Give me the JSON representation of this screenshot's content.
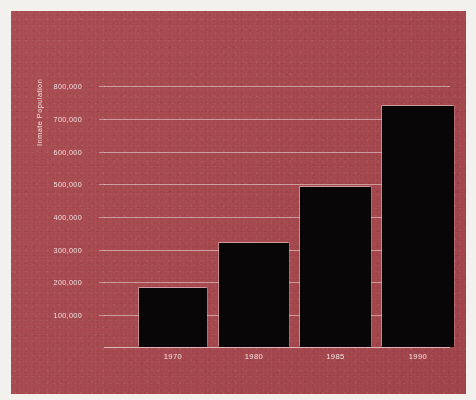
{
  "chart_data": {
    "type": "bar",
    "title": "",
    "subtitle": "",
    "xlabel": "",
    "ylabel": "Inmate Population",
    "categories": [
      "1970",
      "1980",
      "1985",
      "1990"
    ],
    "values": [
      180000,
      318000,
      490000,
      740000
    ],
    "series": [
      {
        "name": "Inmate Population",
        "values": [
          180000,
          318000,
          490000,
          740000
        ]
      }
    ],
    "ylim": [
      0,
      850000
    ],
    "ytick_labels": [
      "800,000",
      "700,000",
      "600,000",
      "500,000",
      "400,000",
      "300,000",
      "200,000",
      "100,000"
    ],
    "ytick_values": [
      800000,
      700000,
      600000,
      500000,
      400000,
      300000,
      200000,
      100000
    ],
    "grid": true,
    "grid_axis": "y",
    "legend": false,
    "legend_position": "none",
    "bar_color": "#080607",
    "background_color": "#a8484e",
    "grid_color": "#e8cdcd",
    "text_color": "#f0dede",
    "page_color": "#f3f1ee"
  },
  "axis": {
    "y_title": "Inmate Population",
    "ticks": [
      {
        "label": "800,000",
        "value": 800000
      },
      {
        "label": "700,000",
        "value": 700000
      },
      {
        "label": "600,000",
        "value": 600000
      },
      {
        "label": "500,000",
        "value": 500000
      },
      {
        "label": "400,000",
        "value": 400000
      },
      {
        "label": "300,000",
        "value": 300000
      },
      {
        "label": "200,000",
        "value": 200000
      },
      {
        "label": "100,000",
        "value": 100000
      }
    ]
  },
  "bars": [
    {
      "category": "1970",
      "value": 180000
    },
    {
      "category": "1980",
      "value": 318000
    },
    {
      "category": "1985",
      "value": 490000
    },
    {
      "category": "1990",
      "value": 740000
    }
  ]
}
